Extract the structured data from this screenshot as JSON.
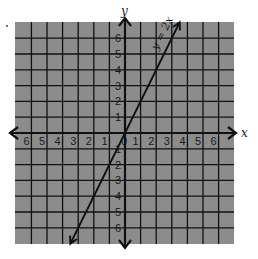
{
  "chart_data": {
    "type": "line",
    "title": "",
    "xlabel": "x",
    "ylabel": "y",
    "xlim": [
      -7,
      7
    ],
    "ylim": [
      -7,
      7
    ],
    "grid": true,
    "x_ticks": [
      -6,
      -5,
      -4,
      -3,
      -2,
      -1,
      0,
      1,
      2,
      3,
      4,
      5,
      6
    ],
    "y_ticks": [
      -6,
      -5,
      -4,
      -3,
      -2,
      -1,
      1,
      2,
      3,
      4,
      5,
      6
    ],
    "x_tick_labels": [
      "6",
      "5",
      "4",
      "3",
      "2",
      "1",
      "0",
      "1",
      "2",
      "3",
      "4",
      "5",
      "6"
    ],
    "y_tick_labels": [
      "6",
      "5",
      "4",
      "3",
      "2",
      "1",
      "1",
      "2",
      "3",
      "4",
      "5",
      "6"
    ],
    "series": [
      {
        "name": "y = 2x",
        "equation": "y = 2x",
        "slope": 2,
        "intercept": 0,
        "x": [
          -3.5,
          3.5
        ],
        "y": [
          -7,
          7
        ]
      }
    ],
    "annotations": [
      {
        "text": "y = 2x",
        "position": "along line, upper right"
      }
    ],
    "legend": null
  },
  "colors": {
    "grid_background": "#8c8c8c",
    "grid_lines": "#111111",
    "axes": "#111111",
    "line": "#111111"
  },
  "labels": {
    "x_axis": "x",
    "y_axis": "y",
    "equation": "y = 2x",
    "origin": "0"
  }
}
